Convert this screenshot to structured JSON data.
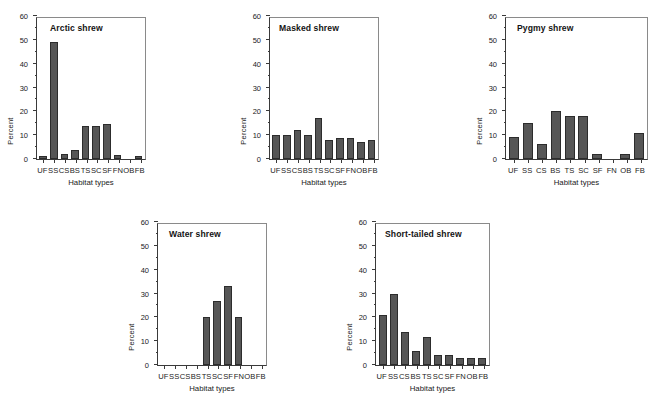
{
  "figure": {
    "background": "#ffffff",
    "bar_color": "#565656",
    "bar_edge_color": "#2c2c2c",
    "axis_color": "#3a3a3a"
  },
  "axis": {
    "ylabel": "Percent",
    "xlabel": "Habitat types",
    "ytick_labels": [
      "0",
      "10",
      "20",
      "30",
      "40",
      "50",
      "60"
    ],
    "ymin": 0,
    "ymax": 60
  },
  "chart_data": [
    {
      "type": "bar",
      "title": "Arctic shrew",
      "xlabel": "Habitat types",
      "ylabel": "Percent",
      "ylim": [
        0,
        60
      ],
      "yticks": [
        0,
        10,
        20,
        30,
        40,
        50,
        60
      ],
      "grid": false,
      "legend": null,
      "categories": [
        "UF",
        "SS",
        "CS",
        "BS",
        "TS",
        "SC",
        "SF",
        "FN",
        "OB",
        "FB"
      ],
      "values": [
        1.3,
        49,
        2,
        3.8,
        14,
        14,
        14.7,
        1.7,
        0,
        1.1
      ]
    },
    {
      "type": "bar",
      "title": "Masked shrew",
      "xlabel": "Habitat types",
      "ylabel": "Percent",
      "ylim": [
        0,
        60
      ],
      "yticks": [
        0,
        10,
        20,
        30,
        40,
        50,
        60
      ],
      "grid": false,
      "legend": null,
      "categories": [
        "UF",
        "SS",
        "CS",
        "BS",
        "TS",
        "SC",
        "SF",
        "FN",
        "OB",
        "FB"
      ],
      "values": [
        10,
        10,
        12,
        10,
        17,
        8,
        9,
        9,
        7,
        8
      ]
    },
    {
      "type": "bar",
      "title": "Pygmy shrew",
      "xlabel": "Habitat types",
      "ylabel": "Percent",
      "ylim": [
        0,
        60
      ],
      "yticks": [
        0,
        10,
        20,
        30,
        40,
        50,
        60
      ],
      "grid": false,
      "legend": null,
      "categories": [
        "UF",
        "SS",
        "CS",
        "BS",
        "TS",
        "SC",
        "SF",
        "FN",
        "OB",
        "FB"
      ],
      "values": [
        9.3,
        15.2,
        6.2,
        20.2,
        18.1,
        18.1,
        2,
        0,
        2,
        11
      ]
    },
    {
      "type": "bar",
      "title": "Water shrew",
      "xlabel": "Habitat types",
      "ylabel": "Percent",
      "ylim": [
        0,
        60
      ],
      "yticks": [
        0,
        10,
        20,
        30,
        40,
        50,
        60
      ],
      "grid": false,
      "legend": null,
      "categories": [
        "UF",
        "SS",
        "CS",
        "BS",
        "TS",
        "SC",
        "SF",
        "FN",
        "OB",
        "FB"
      ],
      "values": [
        0,
        0,
        0,
        0,
        20,
        27,
        33,
        20,
        0,
        0
      ]
    },
    {
      "type": "bar",
      "title": "Short-tailed shrew",
      "xlabel": "Habitat types",
      "ylabel": "Percent",
      "ylim": [
        0,
        60
      ],
      "yticks": [
        0,
        10,
        20,
        30,
        40,
        50,
        60
      ],
      "grid": false,
      "legend": null,
      "categories": [
        "UF",
        "SS",
        "CS",
        "BS",
        "TS",
        "SC",
        "SF",
        "FN",
        "OB",
        "FB"
      ],
      "values": [
        21,
        30,
        14,
        6,
        11.7,
        4.1,
        4.1,
        2.8,
        2.8,
        2.8
      ]
    }
  ],
  "panels": [
    {
      "id": "arctic-shrew",
      "plot": {
        "left": 36,
        "top": 17,
        "width": 110,
        "height": 143
      },
      "title_offset": {
        "x": 14,
        "y": 6
      }
    },
    {
      "id": "masked-shrew",
      "plot": {
        "left": 269,
        "top": 17,
        "width": 110,
        "height": 143
      },
      "title_offset": {
        "x": 10,
        "y": 6
      }
    },
    {
      "id": "pygmy-shrew",
      "plot": {
        "left": 505,
        "top": 17,
        "width": 143,
        "height": 143
      },
      "title_offset": {
        "x": 12,
        "y": 6
      }
    },
    {
      "id": "water-shrew",
      "plot": {
        "left": 157,
        "top": 223,
        "width": 110,
        "height": 143
      },
      "title_offset": {
        "x": 12,
        "y": 6
      }
    },
    {
      "id": "short-tailed-shrew",
      "plot": {
        "left": 375,
        "top": 223,
        "width": 115,
        "height": 143
      },
      "title_offset": {
        "x": 10,
        "y": 6
      }
    }
  ]
}
